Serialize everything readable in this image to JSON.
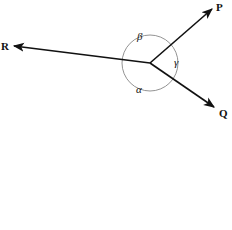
{
  "diagram": {
    "type": "vector-angles",
    "center": {
      "x": 150,
      "y": 63
    },
    "vectors": [
      {
        "label": "P",
        "tip": {
          "x": 212,
          "y": 9
        },
        "label_pos": {
          "x": 216,
          "y": 11
        }
      },
      {
        "label": "Q",
        "tip": {
          "x": 214,
          "y": 107
        },
        "label_pos": {
          "x": 219,
          "y": 117
        }
      },
      {
        "label": "R",
        "tip": {
          "x": 14,
          "y": 46
        },
        "label_pos": {
          "x": 1,
          "y": 50
        }
      }
    ],
    "angles": [
      {
        "label": "β",
        "between": [
          "R",
          "P"
        ],
        "label_pos": {
          "x": 137,
          "y": 40
        }
      },
      {
        "label": "γ",
        "between": [
          "P",
          "Q"
        ],
        "label_pos": {
          "x": 174,
          "y": 66
        }
      },
      {
        "label": "α",
        "between": [
          "Q",
          "R"
        ],
        "label_pos": {
          "x": 136,
          "y": 93
        }
      }
    ],
    "arc_radius": 28,
    "colors": {
      "vector": "#111111",
      "arc": "#666666"
    }
  }
}
